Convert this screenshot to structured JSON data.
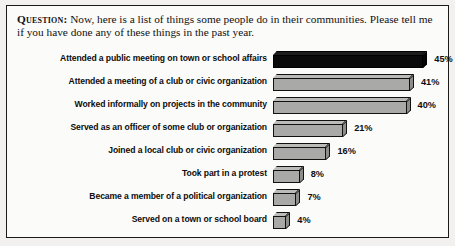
{
  "question": {
    "tag": "Question:",
    "text": " Now, here is a list of things some people do in their communities. Please tell me if you have done any of these things in the past year."
  },
  "chart_data": {
    "type": "bar",
    "orientation": "horizontal",
    "title": "",
    "xlabel": "",
    "ylabel": "",
    "xlim": [
      0,
      50
    ],
    "grid": false,
    "legend": false,
    "value_suffix": "%",
    "highlight_index": 0,
    "colors": {
      "bar_fill": "#a9a9a7",
      "bar_top": "#bbbbb8",
      "bar_side": "#8d8d8b",
      "bar_outline": "#111111",
      "highlight_fill": "#0a0a0a",
      "text": "#0d0d0d",
      "page_background": "#fbfbfa",
      "frame_border": "#1a1a1a"
    },
    "categories": [
      "Attended a public meeting on town or school affairs",
      "Attended a meeting of a club or civic organization",
      "Worked informally on projects in the community",
      "Served as an officer of some club or organization",
      "Joined a local club or civic organization",
      "Took part in a protest",
      "Became a member of a political organization",
      "Served on a town or school board"
    ],
    "values": [
      45,
      41,
      40,
      21,
      16,
      8,
      7,
      4
    ],
    "value_labels": [
      "45%",
      "41%",
      "40%",
      "21%",
      "16%",
      "8%",
      "7%",
      "4%"
    ]
  }
}
